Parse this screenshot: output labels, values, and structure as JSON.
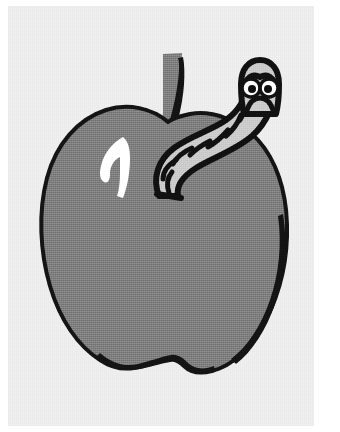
{
  "image": {
    "title": "Cartoon apple with a worm",
    "kind": "clip-art-illustration",
    "width": 340,
    "height": 432,
    "background_color": "#ffffff",
    "paper_color": "#f3f3f3"
  },
  "palette": {
    "apple_fill": "#808080",
    "apple_outline": "#141414",
    "stem_fill": "#808080",
    "stem_outline": "#141414",
    "highlight_fill": "#ffffff",
    "worm_fill": "#cccccc",
    "worm_outline": "#111111",
    "eye_white": "#ffffff",
    "eye_pupil": "#101010",
    "mouth": "#111111"
  },
  "objects": {
    "apple": {
      "label": "apple-body",
      "fill": "#808080",
      "stroke": "#141414",
      "stroke_width": 4,
      "bounds": {
        "x": 42,
        "y": 108,
        "width": 248,
        "height": 262
      }
    },
    "stem": {
      "label": "apple-stem",
      "fill": "#808080",
      "stroke": "#141414",
      "bounds": {
        "x": 158,
        "y": 52,
        "width": 32,
        "height": 78
      }
    },
    "highlight": {
      "label": "apple-highlight",
      "fill": "#ffffff",
      "bounds": {
        "x": 99,
        "y": 136,
        "width": 32,
        "height": 62
      }
    },
    "worm": {
      "label": "worm",
      "fill": "#cccccc",
      "stroke": "#111111",
      "stroke_width": 6,
      "segments": 8,
      "bounds": {
        "x": 152,
        "y": 62,
        "width": 124,
        "height": 135
      },
      "face": {
        "eyes": 2,
        "eye_fill": "#ffffff",
        "pupil_fill": "#101010",
        "expression": "frowning"
      }
    }
  }
}
